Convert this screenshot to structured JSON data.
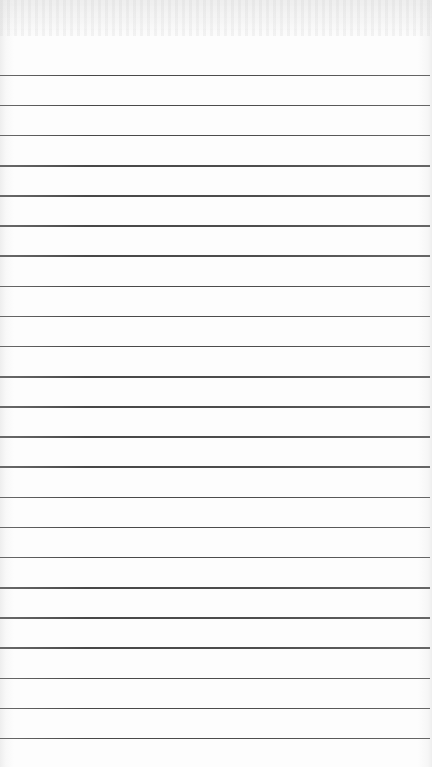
{
  "document": {
    "type": "lined-paper",
    "description": "Blank ruled notebook page",
    "rule_count": 23,
    "text_content": "",
    "colors": {
      "paper": "#fdfdfd",
      "rule": "#3a3a3a"
    }
  }
}
